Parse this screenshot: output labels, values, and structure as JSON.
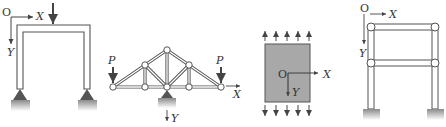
{
  "figures": [
    {
      "name": "portal-frame",
      "origin_label": "O",
      "x_axis_label": "X",
      "y_axis_label": "Y",
      "supports": 2,
      "loads": 1
    },
    {
      "name": "roof-truss",
      "load_label_left": "P",
      "load_label_right": "P",
      "x_axis_label": "X",
      "y_axis_label": "Y",
      "supports": 1
    },
    {
      "name": "plate-panel",
      "origin_label": "O",
      "x_axis_label": "X",
      "y_axis_label": "Y",
      "distributed_load_arrows": 5
    },
    {
      "name": "two-story-frame",
      "origin_label": "O",
      "x_axis_label": "X",
      "y_axis_label": "Y",
      "stories": 2
    }
  ],
  "colors": {
    "member_stroke": "#555555",
    "member_fill": "#ffffff",
    "support_fill": "#555555",
    "ground_fill": "#9a9a9a",
    "panel_fill": "#a8a8a8",
    "arrow": "#444444"
  }
}
